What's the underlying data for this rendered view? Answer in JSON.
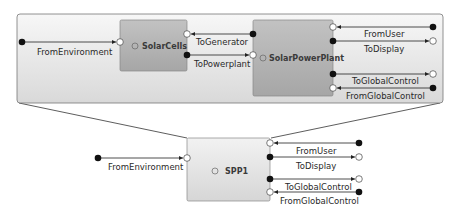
{
  "diagram": {
    "expanded_panel": {
      "blocks": [
        {
          "name": "SolarCells",
          "icon": "expand-icon"
        },
        {
          "name": "SolarPowerPlant",
          "icon": "expand-icon"
        }
      ],
      "signals": {
        "from_environment": "FromEnvironment",
        "to_generator": "ToGenerator",
        "to_powerplant": "ToPowerplant",
        "from_user": "FromUser",
        "to_display": "ToDisplay",
        "to_global_control": "ToGlobalControl",
        "from_global_control": "FromGlobalControl"
      }
    },
    "parent_block": {
      "name": "SPP1",
      "icon": "expand-icon",
      "signals": {
        "from_environment": "FromEnvironment",
        "from_user": "FromUser",
        "to_display": "ToDisplay",
        "to_global_control": "ToGlobalControl",
        "from_global_control": "FromGlobalControl"
      }
    },
    "colors": {
      "block_fill_top": "#c4c4c4",
      "block_fill_bottom": "#a9a9a9",
      "panel_fill_top": "#f7f7f7",
      "panel_fill_bottom": "#dcdcdc",
      "port_filled": "#111111",
      "port_open": "#ffffff"
    }
  }
}
